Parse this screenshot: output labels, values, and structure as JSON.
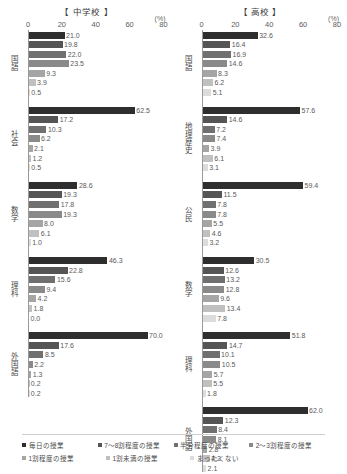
{
  "axis": {
    "unit_label": "(%)",
    "ticks": [
      0,
      20,
      40,
      60,
      80
    ],
    "max": 80
  },
  "legend": {
    "items": [
      {
        "label": "毎日の授業",
        "color": "#2e2e2e"
      },
      {
        "label": "7～8割程度の授業",
        "color": "#555555"
      },
      {
        "label": "半分程度の授業",
        "color": "#707070"
      },
      {
        "label": "2～3割程度の授業",
        "color": "#8a8a8a"
      },
      {
        "label": "1割程度の授業",
        "color": "#a5a5a5"
      },
      {
        "label": "1割未満の授業",
        "color": "#c0c0c0"
      },
      {
        "label": "まったくない",
        "color": "#dcdcdc"
      }
    ]
  },
  "chart_data": {
    "type": "bar",
    "title": "",
    "xlabel": "(%)",
    "ylabel": "",
    "xlim": [
      0,
      80
    ],
    "grid": false,
    "legend_position": "bottom",
    "series": [
      {
        "name": "毎日の授業",
        "color": "#2e2e2e"
      },
      {
        "name": "7～8割程度の授業",
        "color": "#555555"
      },
      {
        "name": "半分程度の授業",
        "color": "#707070"
      },
      {
        "name": "2～3割程度の授業",
        "color": "#8a8a8a"
      },
      {
        "name": "1割程度の授業",
        "color": "#a5a5a5"
      },
      {
        "name": "1割未満の授業",
        "color": "#c0c0c0"
      },
      {
        "name": "まったくない",
        "color": "#dcdcdc"
      }
    ],
    "panels": [
      {
        "title": "【 中学校 】",
        "groups": [
          {
            "category": "国語",
            "values": [
              21.0,
              19.8,
              22.0,
              23.5,
              9.3,
              3.9,
              0.5
            ]
          },
          {
            "category": "社会",
            "values": [
              62.5,
              17.2,
              10.3,
              6.2,
              2.1,
              1.2,
              0.5
            ]
          },
          {
            "category": "数学",
            "values": [
              28.6,
              19.3,
              17.8,
              19.3,
              8.0,
              6.1,
              1.0
            ]
          },
          {
            "category": "理科",
            "values": [
              46.3,
              22.8,
              15.6,
              9.4,
              4.2,
              1.8,
              0.0
            ]
          },
          {
            "category": "外国語",
            "values": [
              70.0,
              17.6,
              8.5,
              2.2,
              1.3,
              0.2,
              0.2
            ]
          }
        ]
      },
      {
        "title": "【 高校 】",
        "groups": [
          {
            "category": "国語",
            "values": [
              32.6,
              16.4,
              16.9,
              14.6,
              8.3,
              6.2,
              5.1
            ]
          },
          {
            "category": "地理歴史",
            "values": [
              57.6,
              14.6,
              7.2,
              7.4,
              3.9,
              6.1,
              3.1
            ]
          },
          {
            "category": "公民",
            "values": [
              59.4,
              11.5,
              7.8,
              7.8,
              5.5,
              4.6,
              3.2
            ]
          },
          {
            "category": "数学",
            "values": [
              30.5,
              12.6,
              13.2,
              12.8,
              9.6,
              13.4,
              7.8
            ]
          },
          {
            "category": "理科",
            "values": [
              51.8,
              14.7,
              10.1,
              10.5,
              5.7,
              5.5,
              1.8
            ]
          },
          {
            "category": "外国語",
            "values": [
              62.0,
              12.3,
              8.4,
              8.1,
              2.8,
              4.2,
              2.1
            ]
          }
        ]
      }
    ]
  }
}
